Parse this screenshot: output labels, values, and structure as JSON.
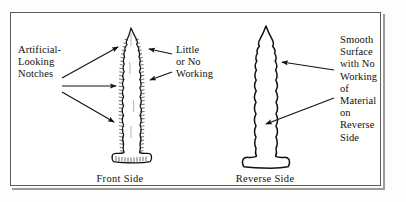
{
  "figure": {
    "background_color": "#fdfdfb",
    "border_color": "#5c5c5c",
    "ink_color": "#111111"
  },
  "labels": {
    "left": "Artificial-\nLooking\nNotches",
    "right": "Little\nor No\nWorking",
    "reverse": "Smooth\nSurface\nwith No\nWorking\nof\nMaterial\non\nReverse\nSide"
  },
  "captions": {
    "front": "Front Side",
    "reverse": "Reverse Side"
  },
  "artifacts": [
    {
      "name": "front-side-projectile-point",
      "description": "Stemmed projectile point drawn with hatched, serrated flaked edges",
      "caption": "Front Side"
    },
    {
      "name": "reverse-side-projectile-point",
      "description": "Plain outline of the same point showing smooth unworked surface",
      "caption": "Reverse Side"
    }
  ],
  "arrows": {
    "left_count": 3,
    "right_count": 2,
    "reverse_count": 2
  }
}
